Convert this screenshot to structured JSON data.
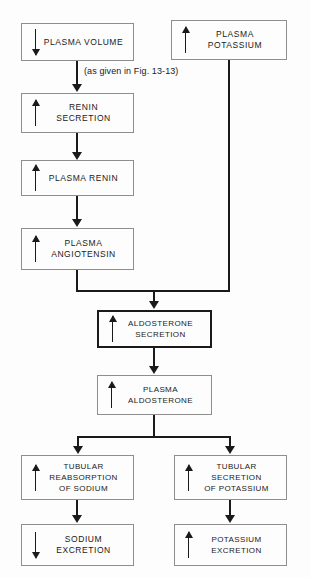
{
  "figure": {
    "type": "flowchart",
    "background_color": "#fdfdfd",
    "line_color": "#1a1a1a",
    "box_border_color": "#8e8e8e",
    "emphasis_border_color": "#1a1a1a"
  },
  "annotation": {
    "fig_reference": "(as given in Fig. 13-13)"
  },
  "nodes": {
    "plasma_volume": {
      "label": "PLASMA VOLUME",
      "direction": "down",
      "direction_symbol": "↓"
    },
    "plasma_potassium": {
      "label": "PLASMA\nPOTASSIUM",
      "direction": "up",
      "direction_symbol": "↑"
    },
    "renin_secretion": {
      "label": "RENIN\nSECRETION",
      "direction": "up",
      "direction_symbol": "↑"
    },
    "plasma_renin": {
      "label": "PLASMA RENIN",
      "direction": "up",
      "direction_symbol": "↑"
    },
    "plasma_angiotensin": {
      "label": "PLASMA\nANGIOTENSIN",
      "direction": "up",
      "direction_symbol": "↑"
    },
    "aldosterone_secretion": {
      "label": "ALDOSTERONE\nSECRETION",
      "direction": "up",
      "direction_symbol": "↑",
      "emphasized": "true"
    },
    "plasma_aldosterone": {
      "label": "PLASMA\nALDOSTERONE",
      "direction": "up",
      "direction_symbol": "↑"
    },
    "tubular_reabsorption_sodium": {
      "label": "TUBULAR\nREABSORPTION\nOF SODIUM",
      "direction": "up",
      "direction_symbol": "↑"
    },
    "tubular_secretion_potassium": {
      "label": "TUBULAR\nSECRETION\nOF POTASSIUM",
      "direction": "up",
      "direction_symbol": "↑"
    },
    "sodium_excretion": {
      "label": "SODIUM\nEXCRETION",
      "direction": "down",
      "direction_symbol": "↓"
    },
    "potassium_excretion": {
      "label": "POTASSIUM\nEXCRETION",
      "direction": "up",
      "direction_symbol": "↑"
    }
  }
}
